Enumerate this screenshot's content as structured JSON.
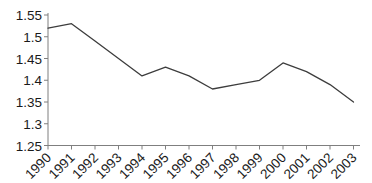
{
  "chart_data": {
    "type": "line",
    "title": "",
    "xlabel": "",
    "ylabel": "",
    "categories": [
      "1990",
      "1991",
      "1992",
      "1993",
      "1994",
      "1995",
      "1996",
      "1997",
      "1998",
      "1999",
      "2000",
      "2001",
      "2002",
      "2003"
    ],
    "values": [
      1.52,
      1.53,
      1.49,
      1.45,
      1.41,
      1.43,
      1.41,
      1.38,
      1.39,
      1.4,
      1.44,
      1.42,
      1.39,
      1.35
    ],
    "ylim": [
      1.25,
      1.55
    ],
    "ytick_step": 0.05,
    "ytick_labels": [
      "1.55",
      "1.5",
      "1.45",
      "1.4",
      "1.35",
      "1.3",
      "1.25"
    ],
    "x_label_rotation_deg": 45,
    "grid": false,
    "legend": false,
    "line_color": "#3d3d3d",
    "axis_color": "#7f7f7f",
    "text_color": "#1a1a1a",
    "background_color": "#ffffff"
  }
}
